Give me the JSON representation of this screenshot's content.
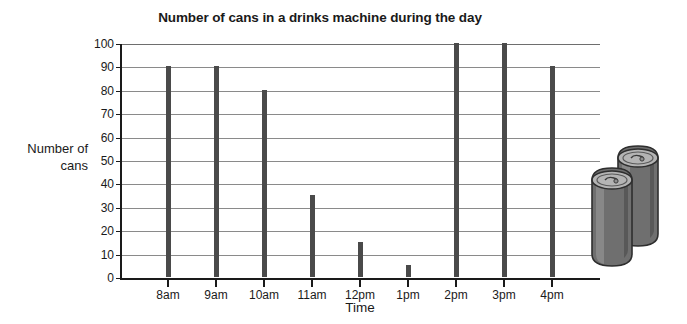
{
  "chart_data": {
    "type": "bar",
    "title": "Number of cans in a drinks machine during the day",
    "xlabel": "Time",
    "ylabel": "Number of cans",
    "categories": [
      "8am",
      "9am",
      "10am",
      "11am",
      "12pm",
      "1pm",
      "2pm",
      "3pm",
      "4pm"
    ],
    "values": [
      90,
      90,
      80,
      35,
      15,
      5,
      100,
      100,
      90
    ],
    "ylim": [
      0,
      100
    ],
    "ytick_step": 10,
    "yticks": [
      0,
      10,
      20,
      30,
      40,
      50,
      60,
      70,
      80,
      90,
      100
    ],
    "grid": true,
    "legend": "none",
    "bar_color": "#4a4a4a",
    "gridline_color": "#8a8a8a",
    "axis_color": "#1a1a1a"
  },
  "title": {
    "text": "Number of cans in a drinks machine during the day"
  },
  "axes": {
    "y_title_line1": "Number of",
    "y_title_line2": "cans",
    "x_title": "Time"
  },
  "illustration": {
    "name": "drinks-cans",
    "body_color": "#7d7d7d",
    "top_color": "#b0b0b0",
    "outline_color": "#2e2e2e"
  }
}
